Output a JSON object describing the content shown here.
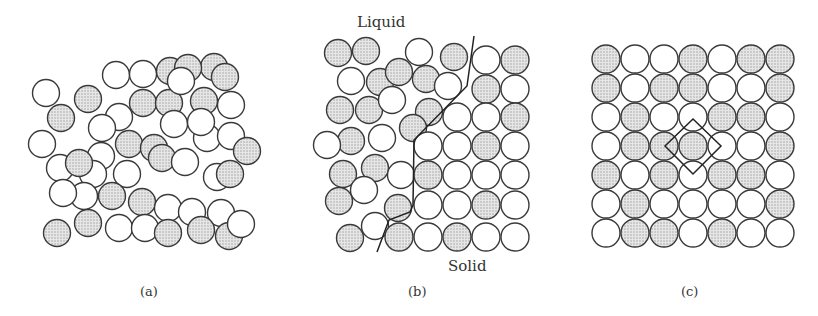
{
  "figure": {
    "panels": [
      {
        "id": "a",
        "caption": "(a)",
        "description": "Random atom arrangement (liquid/amorphous)"
      },
      {
        "id": "b",
        "caption": "(b)",
        "description": "Liquid-solid interface",
        "labels": {
          "liquid": "Liquid",
          "solid": "Solid"
        }
      },
      {
        "id": "c",
        "caption": "(c)",
        "description": "Ordered square lattice with unit cell outlined"
      }
    ],
    "colors": {
      "shaded": "#d9d9d9",
      "open": "#ffffff",
      "stroke": "#3a3a3a"
    },
    "panel_a_atoms": [
      [
        46,
        93,
        0
      ],
      [
        88,
        99,
        1
      ],
      [
        116,
        75,
        0
      ],
      [
        143,
        74,
        0
      ],
      [
        170,
        71,
        1
      ],
      [
        214,
        67,
        1
      ],
      [
        188,
        68,
        1
      ],
      [
        225,
        77,
        1
      ],
      [
        119,
        117,
        0
      ],
      [
        143,
        103,
        1
      ],
      [
        169,
        103,
        1
      ],
      [
        181,
        81,
        0
      ],
      [
        204,
        101,
        1
      ],
      [
        231,
        105,
        0
      ],
      [
        207,
        138,
        0
      ],
      [
        61,
        118,
        1
      ],
      [
        102,
        128,
        0
      ],
      [
        129,
        144,
        1
      ],
      [
        154,
        148,
        1
      ],
      [
        174,
        124,
        0
      ],
      [
        201,
        122,
        0
      ],
      [
        231,
        136,
        0
      ],
      [
        42,
        144,
        0
      ],
      [
        101,
        156,
        0
      ],
      [
        60,
        168,
        0
      ],
      [
        93,
        174,
        0
      ],
      [
        127,
        174,
        0
      ],
      [
        162,
        158,
        1
      ],
      [
        185,
        162,
        0
      ],
      [
        217,
        177,
        0
      ],
      [
        247,
        151,
        1
      ],
      [
        230,
        174,
        1
      ],
      [
        84,
        196,
        0
      ],
      [
        79,
        163,
        1
      ],
      [
        112,
        196,
        1
      ],
      [
        142,
        202,
        1
      ],
      [
        168,
        208,
        0
      ],
      [
        192,
        212,
        0
      ],
      [
        221,
        213,
        0
      ],
      [
        88,
        223,
        1
      ],
      [
        119,
        228,
        0
      ],
      [
        145,
        228,
        0
      ],
      [
        168,
        233,
        1
      ],
      [
        201,
        230,
        1
      ],
      [
        229,
        236,
        1
      ],
      [
        241,
        224,
        0
      ],
      [
        63,
        193,
        0
      ],
      [
        57,
        233,
        1
      ]
    ],
    "panel_b_liquid_atoms": [
      [
        338,
        53,
        1
      ],
      [
        366,
        51,
        1
      ],
      [
        351,
        81,
        0
      ],
      [
        380,
        82,
        1
      ],
      [
        399,
        72,
        1
      ],
      [
        426,
        79,
        1
      ],
      [
        448,
        86,
        0
      ],
      [
        419,
        52,
        0
      ],
      [
        340,
        110,
        1
      ],
      [
        369,
        110,
        1
      ],
      [
        392,
        100,
        0
      ],
      [
        429,
        112,
        1
      ],
      [
        454,
        57,
        1
      ],
      [
        413,
        128,
        1
      ],
      [
        351,
        141,
        1
      ],
      [
        382,
        138,
        0
      ],
      [
        327,
        145,
        0
      ],
      [
        343,
        174,
        1
      ],
      [
        375,
        168,
        1
      ],
      [
        401,
        175,
        0
      ],
      [
        339,
        201,
        1
      ],
      [
        364,
        190,
        0
      ],
      [
        398,
        208,
        1
      ],
      [
        375,
        226,
        0
      ],
      [
        350,
        238,
        1
      ]
    ],
    "panel_b_solid_atoms": [
      [
        486,
        60,
        0
      ],
      [
        515,
        60,
        1
      ],
      [
        486,
        89,
        1
      ],
      [
        515,
        89,
        0
      ],
      [
        457,
        117,
        0
      ],
      [
        486,
        117,
        0
      ],
      [
        515,
        117,
        1
      ],
      [
        428,
        146,
        0
      ],
      [
        457,
        146,
        0
      ],
      [
        486,
        146,
        1
      ],
      [
        515,
        146,
        0
      ],
      [
        428,
        175,
        1
      ],
      [
        457,
        175,
        0
      ],
      [
        486,
        175,
        0
      ],
      [
        515,
        175,
        0
      ],
      [
        428,
        205,
        0
      ],
      [
        457,
        205,
        0
      ],
      [
        486,
        205,
        1
      ],
      [
        515,
        205,
        0
      ],
      [
        399,
        237,
        1
      ],
      [
        428,
        237,
        0
      ],
      [
        457,
        237,
        1
      ],
      [
        486,
        237,
        0
      ],
      [
        515,
        237,
        0
      ]
    ],
    "panel_b_boundary": "474,36 467,86 414,140 413,205 410,212 389,220 377,252",
    "panel_c_grid": {
      "rows": [
        [
          1,
          0,
          0,
          1,
          0,
          1,
          1
        ],
        [
          1,
          0,
          1,
          1,
          0,
          0,
          1
        ],
        [
          0,
          1,
          0,
          0,
          1,
          1,
          0
        ],
        [
          0,
          1,
          1,
          1,
          0,
          0,
          1
        ],
        [
          1,
          0,
          1,
          0,
          1,
          1,
          0
        ],
        [
          0,
          1,
          0,
          0,
          0,
          0,
          1
        ],
        [
          0,
          1,
          1,
          0,
          1,
          0,
          0
        ]
      ],
      "origin_x": 606,
      "origin_y": 59,
      "pitch": 29,
      "radius": 14
    },
    "panel_c_unitcell": "693,119 721,146 693,174 665,146"
  }
}
